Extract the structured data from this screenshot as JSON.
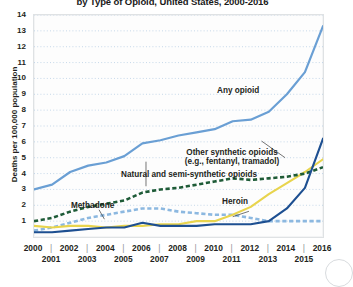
{
  "chart_data": {
    "type": "line",
    "title": "by Type of Opioid, United States, 2000-2016",
    "xlabel": "",
    "ylabel": "Deaths per 100,000 population",
    "xlim": [
      2000,
      2016
    ],
    "ylim": [
      0,
      14
    ],
    "grid": true,
    "legend_position": "inline-annotations",
    "x": [
      2000,
      2001,
      2002,
      2003,
      2004,
      2005,
      2006,
      2007,
      2008,
      2009,
      2010,
      2011,
      2012,
      2013,
      2014,
      2015,
      2016
    ],
    "y_ticks": [
      1,
      2,
      3,
      4,
      5,
      6,
      7,
      8,
      9,
      10,
      11,
      12,
      13,
      14
    ],
    "x_ticks_row0": [
      2000,
      2002,
      2004,
      2006,
      2008,
      2010,
      2012,
      2014,
      2016
    ],
    "x_ticks_row1": [
      2001,
      2003,
      2005,
      2007,
      2009,
      2011,
      2013,
      2015
    ],
    "series": [
      {
        "name": "Any opioid",
        "color": "#6a9fd4",
        "style": "solid",
        "label": "Any opioid",
        "values": [
          3.0,
          3.3,
          4.1,
          4.5,
          4.7,
          5.1,
          5.9,
          6.1,
          6.4,
          6.6,
          6.8,
          7.3,
          7.4,
          7.9,
          9.0,
          10.4,
          13.3
        ]
      },
      {
        "name": "Other synthetic opioids",
        "color": "#1d4f91",
        "style": "solid",
        "label": "Other synthetic opioids (e.g., fentanyl, tramadol)",
        "values": [
          0.3,
          0.3,
          0.4,
          0.5,
          0.6,
          0.6,
          0.9,
          0.7,
          0.7,
          0.7,
          0.8,
          0.8,
          0.8,
          1.0,
          1.8,
          3.1,
          6.2
        ]
      },
      {
        "name": "Natural and semi-synthetic opioids",
        "color": "#1e5b37",
        "style": "dashed",
        "label": "Natural and semi-synthetic opioids",
        "values": [
          1.0,
          1.2,
          1.6,
          1.9,
          2.1,
          2.3,
          2.8,
          3.0,
          3.1,
          3.3,
          3.5,
          3.7,
          3.6,
          3.7,
          3.8,
          4.0,
          4.4
        ]
      },
      {
        "name": "Methadone",
        "color": "#8cb8e0",
        "style": "dashed",
        "label": "Methadone",
        "values": [
          0.4,
          0.6,
          0.9,
          1.2,
          1.4,
          1.6,
          1.8,
          1.8,
          1.6,
          1.5,
          1.4,
          1.4,
          1.2,
          1.0,
          1.0,
          1.0,
          1.0
        ]
      },
      {
        "name": "Heroin",
        "color": "#e8d44d",
        "style": "solid",
        "label": "Heroin",
        "values": [
          0.7,
          0.6,
          0.7,
          0.7,
          0.6,
          0.7,
          0.7,
          0.8,
          0.8,
          1.0,
          1.0,
          1.4,
          1.9,
          2.7,
          3.4,
          4.1,
          4.9
        ]
      }
    ],
    "annotations": [
      {
        "text": "Any opioid",
        "series": "Any opioid"
      },
      {
        "text": "Other synthetic opioids",
        "series": "Other synthetic opioids"
      },
      {
        "text": "(e.g., fentanyl, tramadol)",
        "series": "Other synthetic opioids"
      },
      {
        "text": "Natural and semi-synthetic opioids",
        "series": "Natural and semi-synthetic opioids"
      },
      {
        "text": "Methadone",
        "series": "Methadone"
      },
      {
        "text": "Heroin",
        "series": "Heroin"
      }
    ]
  },
  "labels": {
    "any_opioid": "Any opioid",
    "other_synth_1": "Other synthetic opioids",
    "other_synth_2": "(e.g., fentanyl, tramadol)",
    "natural_semi": "Natural and semi-synthetic opioids",
    "methadone": "Methadone",
    "heroin": "Heroin"
  }
}
